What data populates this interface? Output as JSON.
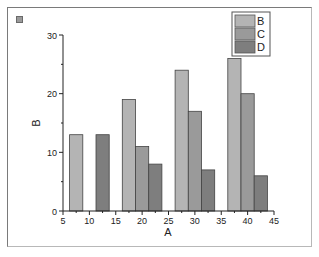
{
  "chart_data": {
    "type": "bar",
    "title": "",
    "xlabel": "A",
    "ylabel": "B",
    "xlim": [
      5,
      45
    ],
    "ylim": [
      0,
      30
    ],
    "x_ticks": [
      5,
      10,
      15,
      20,
      25,
      30,
      35,
      40,
      45
    ],
    "y_ticks": [
      0,
      10,
      20,
      30
    ],
    "grid": false,
    "legend_position": "top-right",
    "series": [
      {
        "name": "B",
        "color": "#b4b4b4",
        "x": [
          7.5,
          17.5,
          27.5,
          37.5
        ],
        "values": [
          13,
          19,
          24,
          26
        ]
      },
      {
        "name": "C",
        "color": "#9a9a9a",
        "x": [
          20,
          30,
          40
        ],
        "values": [
          11,
          17,
          20
        ]
      },
      {
        "name": "D",
        "color": "#7e7e7e",
        "x": [
          12.5,
          22.5,
          32.5,
          42.5
        ],
        "values": [
          13,
          8,
          7,
          6
        ]
      }
    ]
  },
  "labels": {
    "xlabel": "A",
    "ylabel": "B",
    "legend": [
      "B",
      "C",
      "D"
    ],
    "x_ticks": [
      "5",
      "10",
      "15",
      "20",
      "25",
      "30",
      "35",
      "40",
      "45"
    ],
    "y_ticks": [
      "0",
      "10",
      "20",
      "30"
    ]
  }
}
